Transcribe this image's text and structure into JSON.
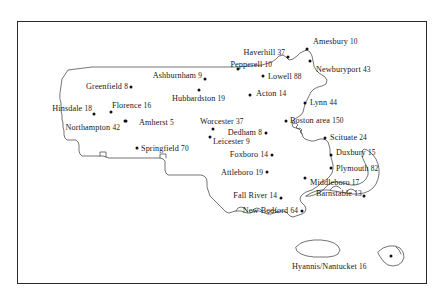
{
  "figure": {
    "frame_color": "#2b2b2b",
    "dot_color": "#111111",
    "text_color": "#17171a",
    "background": "#ffffff"
  },
  "chart_data": {
    "type": "scatter",
    "title": "",
    "xlabel": "",
    "ylabel": "",
    "grid": false,
    "legend": "none",
    "categories": [
      "Amesbury",
      "Haverhill",
      "Pepperell",
      "Newburyport",
      "Lowell",
      "Ashburnham",
      "Greenfield",
      "Hubbardston",
      "Acton",
      "Lynn",
      "Hinsdale",
      "Florence",
      "Amherst",
      "Worcester",
      "Boston area",
      "Northampton",
      "Dedham",
      "Leicester",
      "Scituate",
      "Springfield",
      "Foxboro",
      "Duxbury",
      "Plymouth",
      "Attleboro",
      "Middleboro",
      "Barnstable",
      "Fall River",
      "New Bedford",
      "Hyannis/Nantucket"
    ],
    "values": [
      10,
      37,
      10,
      43,
      88,
      9,
      8,
      19,
      14,
      44,
      18,
      16,
      5,
      37,
      150,
      42,
      8,
      9,
      24,
      70,
      14,
      15,
      82,
      19,
      17,
      13,
      14,
      64,
      16
    ]
  },
  "points": [
    {
      "name": "Amesbury",
      "value": "10",
      "label": "Amesbury 10",
      "dot_x": 307,
      "dot_y": 49,
      "label_x": 313,
      "label_y": 41,
      "anchor": "start"
    },
    {
      "name": "Haverhill",
      "value": "37",
      "label": "Haverhill 37",
      "dot_x": 288,
      "dot_y": 57,
      "label_x": 285,
      "label_y": 52,
      "anchor": "end"
    },
    {
      "name": "Newburyport",
      "value": "43",
      "label": "Newburyport 43",
      "dot_x": 310,
      "dot_y": 61,
      "label_x": 316,
      "label_y": 69,
      "anchor": "start"
    },
    {
      "name": "Pepperell",
      "value": "10",
      "label": "Pepperell 10",
      "dot_x": 238,
      "dot_y": 69,
      "label_x": 272,
      "label_y": 64,
      "anchor": "end"
    },
    {
      "name": "Lowell",
      "value": "88",
      "label": "Lowell 88",
      "dot_x": 263,
      "dot_y": 76,
      "label_x": 268,
      "label_y": 76,
      "anchor": "start"
    },
    {
      "name": "Ashburnham",
      "value": "9",
      "label": "Ashburnham 9",
      "dot_x": 205,
      "dot_y": 79,
      "label_x": 202,
      "label_y": 75,
      "anchor": "end"
    },
    {
      "name": "Greenfield",
      "value": "8",
      "label": "Greenfield 8",
      "dot_x": 131,
      "dot_y": 87,
      "label_x": 128,
      "label_y": 86,
      "anchor": "end"
    },
    {
      "name": "Acton",
      "value": "14",
      "label": "Acton 14",
      "dot_x": 250,
      "dot_y": 95,
      "label_x": 256,
      "label_y": 93,
      "anchor": "start"
    },
    {
      "name": "Hubbardston",
      "value": "19",
      "label": "Hubbardston 19",
      "dot_x": 199,
      "dot_y": 90,
      "label_x": 172,
      "label_y": 98,
      "anchor": "start"
    },
    {
      "name": "Lynn",
      "value": "44",
      "label": "Lynn 44",
      "dot_x": 305,
      "dot_y": 103,
      "label_x": 310,
      "label_y": 102,
      "anchor": "start"
    },
    {
      "name": "Hinsdale",
      "value": "18",
      "label": "Hinsdale 18",
      "dot_x": 94,
      "dot_y": 114,
      "label_x": 92,
      "label_y": 108,
      "anchor": "end"
    },
    {
      "name": "Florence",
      "value": "16",
      "label": "Florence 16",
      "dot_x": 111,
      "dot_y": 112,
      "label_x": 112,
      "label_y": 105,
      "anchor": "start"
    },
    {
      "name": "Amherst",
      "value": "5",
      "label": "Amherst 5",
      "dot_x": 126,
      "dot_y": 121,
      "label_x": 139,
      "label_y": 122,
      "anchor": "start"
    },
    {
      "name": "Worcester",
      "value": "37",
      "label": "Worcester 37",
      "dot_x": 213,
      "dot_y": 129,
      "label_x": 200,
      "label_y": 121,
      "anchor": "start"
    },
    {
      "name": "Boston area",
      "value": "150",
      "label": "Boston area 150",
      "dot_x": 286,
      "dot_y": 121,
      "label_x": 290,
      "label_y": 120,
      "anchor": "start"
    },
    {
      "name": "Northampton",
      "value": "42",
      "label": "Northampton 42",
      "dot_x": 125,
      "dot_y": 121,
      "label_x": 120,
      "label_y": 127,
      "anchor": "end"
    },
    {
      "name": "Dedham",
      "value": "8",
      "label": "Dedham 8",
      "dot_x": 266,
      "dot_y": 133,
      "label_x": 262,
      "label_y": 132,
      "anchor": "end"
    },
    {
      "name": "Leicester",
      "value": "9",
      "label": "Leicester 9",
      "dot_x": 210,
      "dot_y": 137,
      "label_x": 213,
      "label_y": 141,
      "anchor": "start"
    },
    {
      "name": "Scituate",
      "value": "24",
      "label": "Scituate 24",
      "dot_x": 325,
      "dot_y": 138,
      "label_x": 330,
      "label_y": 137,
      "anchor": "start"
    },
    {
      "name": "Springfield",
      "value": "70",
      "label": "Springfield 70",
      "dot_x": 137,
      "dot_y": 148,
      "label_x": 141,
      "label_y": 148,
      "anchor": "start"
    },
    {
      "name": "Foxboro",
      "value": "14",
      "label": "Foxboro 14",
      "dot_x": 272,
      "dot_y": 155,
      "label_x": 268,
      "label_y": 154,
      "anchor": "end"
    },
    {
      "name": "Duxbury",
      "value": "15",
      "label": "Duxbury 15",
      "dot_x": 331,
      "dot_y": 155,
      "label_x": 336,
      "label_y": 152,
      "anchor": "start"
    },
    {
      "name": "Plymouth",
      "value": "82",
      "label": "Plymouth 82",
      "dot_x": 331,
      "dot_y": 168,
      "label_x": 336,
      "label_y": 168,
      "anchor": "start"
    },
    {
      "name": "Attleboro",
      "value": "19",
      "label": "Attleboro 19",
      "dot_x": 267,
      "dot_y": 172,
      "label_x": 263,
      "label_y": 172,
      "anchor": "end"
    },
    {
      "name": "Middleboro",
      "value": "17",
      "label": "Middleboro 17",
      "dot_x": 305,
      "dot_y": 178,
      "label_x": 310,
      "label_y": 182,
      "anchor": "start"
    },
    {
      "name": "Barnstable",
      "value": "13",
      "label": "Barnstable 13",
      "dot_x": 364,
      "dot_y": 196,
      "label_x": 316,
      "label_y": 193,
      "anchor": "start"
    },
    {
      "name": "Fall River",
      "value": "14",
      "label": "Fall River 14",
      "dot_x": 281,
      "dot_y": 198,
      "label_x": 277,
      "label_y": 195,
      "anchor": "end"
    },
    {
      "name": "New Bedford",
      "value": "64",
      "label": "New Bedford 64",
      "dot_x": 302,
      "dot_y": 211,
      "label_x": 298,
      "label_y": 210,
      "anchor": "end"
    },
    {
      "name": "Hyannis/Nantucket",
      "value": "16",
      "label": "Hyannis/Nantucket 16",
      "dot_x": 391,
      "dot_y": 256,
      "label_x": 292,
      "label_y": 266,
      "anchor": "start"
    }
  ]
}
